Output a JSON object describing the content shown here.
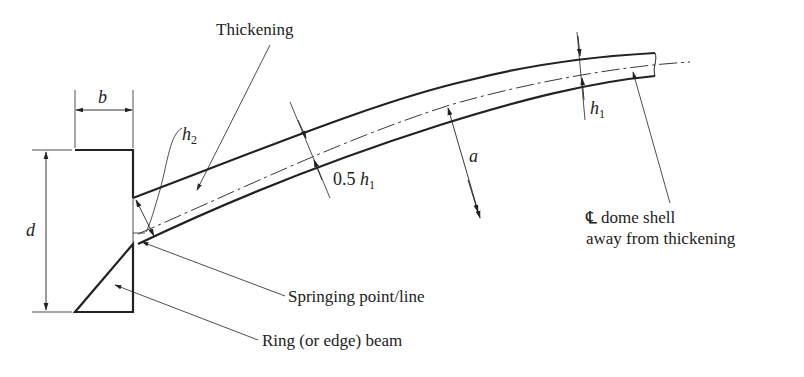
{
  "diagram": {
    "type": "dome shell edge detail (cross-section)",
    "labels": {
      "thickening": "Thickening",
      "b": "b",
      "d": "d",
      "h2_main": "h",
      "h2_sub": "2",
      "h1_main": "h",
      "h1_sub": "1",
      "half_h1_prefix": "0.5 ",
      "half_h1_main": "h",
      "half_h1_sub": "1",
      "a": "a",
      "centerline_symbol": "℄",
      "centerline_line1": "dome shell",
      "centerline_line2": "away from thickening",
      "springing": "Springing point/line",
      "ring_beam": "Ring (or edge) beam"
    },
    "colors": {
      "ink": "#222222",
      "background": "#ffffff"
    }
  }
}
